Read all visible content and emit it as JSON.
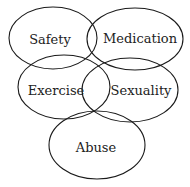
{
  "diagram": {
    "type": "overlapping-ellipses",
    "nodes": [
      {
        "id": "safety",
        "label": "Safety"
      },
      {
        "id": "medication",
        "label": "Medication"
      },
      {
        "id": "exercise",
        "label": "Exercise"
      },
      {
        "id": "sexuality",
        "label": "Sexuality"
      },
      {
        "id": "abuse",
        "label": "Abuse"
      }
    ]
  },
  "colors": {
    "stroke": "#1a1a1a",
    "text": "#222222",
    "background": "#ffffff"
  }
}
